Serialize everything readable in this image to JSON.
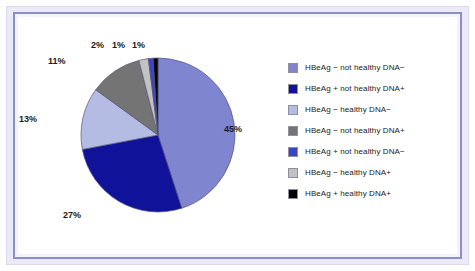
{
  "chart_data": {
    "type": "pie",
    "title": "",
    "subtitle": "",
    "xlabel": "",
    "ylabel": "",
    "legend_position": "right",
    "start_angle_deg": 0,
    "direction": "clockwise",
    "labels": [
      "HBeAg − not healthy DNA−",
      "HBeAg + not healthy DNA+",
      "HBeAg − healthy DNA−",
      "HBeAg − not healthy DNA+",
      "HBeAg + not healthy DNA−",
      "HBeAg − healthy DNA+",
      "HBeAg + healthy DNA+"
    ],
    "values": [
      45,
      27,
      13,
      11,
      1,
      2,
      1
    ],
    "value_labels": [
      "45%",
      "27%",
      "13%",
      "11%",
      "1%",
      "2%",
      "1%"
    ],
    "colors": [
      "#7f85cf",
      "#10139a",
      "#b5bce4",
      "#747474",
      "#3b44c4",
      "#c2c2c2",
      "#000000"
    ],
    "units": "percent"
  },
  "pie": {
    "slices": [
      {
        "label": "HBeAg − not healthy DNA−",
        "value": 45,
        "display": "45%",
        "color": "#7f85cf"
      },
      {
        "label": "HBeAg + not healthy DNA+",
        "value": 27,
        "display": "27%",
        "color": "#10139a"
      },
      {
        "label": "HBeAg − healthy DNA−",
        "value": 13,
        "display": "13%",
        "color": "#b5bce4"
      },
      {
        "label": "HBeAg − not healthy DNA+",
        "value": 11,
        "display": "11%",
        "color": "#747474"
      },
      {
        "label": "HBeAg − healthy DNA+",
        "value": 2,
        "display": "2%",
        "color": "#c2c2c2"
      },
      {
        "label": "HBeAg + not healthy DNA−",
        "value": 1,
        "display": "1%",
        "color": "#3b44c4"
      },
      {
        "label": "HBeAg + healthy DNA+",
        "value": 1,
        "display": "1%",
        "color": "#000000"
      }
    ],
    "callouts": {
      "big": "45%",
      "navy": "27%",
      "lavender": "13%",
      "gray": "11%",
      "lightgray": "2%",
      "royal": "1%",
      "black": "1%"
    }
  },
  "legend": {
    "items": [
      {
        "label": "HBeAg − not healthy DNA−",
        "color": "#7f85cf"
      },
      {
        "label": "HBeAg + not healthy DNA+",
        "color": "#10139a"
      },
      {
        "label": "HBeAg − healthy DNA−",
        "color": "#b5bce4"
      },
      {
        "label": "HBeAg − not healthy DNA+",
        "color": "#747474"
      },
      {
        "label": "HBeAg + not healthy DNA−",
        "color": "#3b44c4"
      },
      {
        "label": "HBeAg − healthy DNA+",
        "color": "#c2c2c2"
      },
      {
        "label": "HBeAg + healthy DNA+",
        "color": "#000000"
      }
    ]
  },
  "theme": {
    "frame_border": "#8d8ec9",
    "frame_fill": "#eceaf7",
    "background": "#ffffff",
    "slice_outline": "#55557a"
  }
}
